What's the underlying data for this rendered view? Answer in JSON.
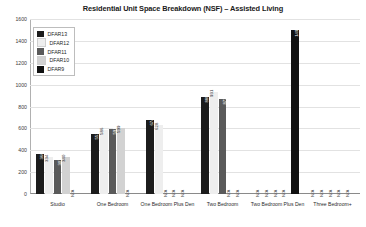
{
  "chart_data": {
    "type": "bar",
    "title": "Residential Unit Space Breakdown (NSF) – Assisted Living",
    "xlabel": "",
    "ylabel": "",
    "ylim": [
      0,
      1600
    ],
    "yticks": [
      0,
      200,
      400,
      600,
      800,
      1000,
      1200,
      1400,
      1600
    ],
    "grid": true,
    "legend_position": "top-left",
    "na_text": "N/A",
    "categories": [
      "Studio",
      "One Bedroom",
      "One Bedroom Plus Den",
      "Two Bedroom",
      "Two Bedroom Plus Den",
      "Three Bedroom+"
    ],
    "series": [
      {
        "name": "DFAR13",
        "color": "#1c1c1c",
        "values": [
          366,
          551,
          674,
          888,
          null,
          null
        ],
        "labels": [
          "366",
          "551",
          "674",
          "888",
          "N/A",
          "N/A"
        ]
      },
      {
        "name": "DFAR12",
        "color": "#eeeeee",
        "values": [
          334,
          586,
          628,
          931,
          null,
          null
        ],
        "labels": [
          "334",
          "586",
          "628",
          "931",
          "N/A",
          "N/A"
        ]
      },
      {
        "name": "DFAR11",
        "color": "#5a5a5a",
        "values": [
          307,
          591,
          null,
          873,
          null,
          null
        ],
        "labels": [
          "307",
          "591",
          "N/A",
          "873",
          "N/A",
          "N/A"
        ]
      },
      {
        "name": "DFAR10",
        "color": "#d2d2d2",
        "values": [
          340,
          599,
          null,
          null,
          null,
          null
        ],
        "labels": [
          "340",
          "599",
          "N/A",
          "N/A",
          "N/A",
          "N/A"
        ]
      },
      {
        "name": "DFAR9",
        "color": "#111111",
        "values": [
          null,
          null,
          null,
          null,
          1497,
          null
        ],
        "labels": [
          "N/A",
          "N/A",
          "N/A",
          "N/A",
          "1497",
          "N/A"
        ]
      }
    ]
  }
}
